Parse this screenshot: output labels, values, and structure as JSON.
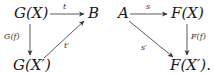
{
  "diagrams": [
    {
      "name": "left-triangle",
      "nodes": {
        "top_left": "G(X)",
        "top_right": "B",
        "bottom_left": "G(X′)"
      },
      "arrows": {
        "top": "t",
        "left": "G(f)",
        "diagonal": "t′"
      }
    },
    {
      "name": "right-triangle",
      "nodes": {
        "top_left": "A",
        "top_right": "F(X)",
        "bottom_right": "F(X′)."
      },
      "arrows": {
        "top": "s",
        "right": "F(f)",
        "diagonal": "s′"
      }
    }
  ],
  "colors": {
    "ink": "#1a1a1a",
    "background": "#ffffff"
  }
}
